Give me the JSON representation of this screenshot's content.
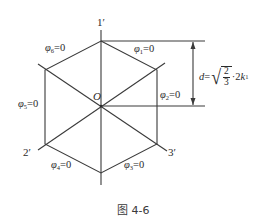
{
  "figure": {
    "caption": "图 4-6",
    "origin_label": "O",
    "axis_labels": {
      "axis1": "1′",
      "axis2": "2′",
      "axis3": "3′"
    },
    "edge_labels": [
      {
        "symbol": "φ",
        "index": "1",
        "rest": "=0"
      },
      {
        "symbol": "φ",
        "index": "2",
        "rest": "=0"
      },
      {
        "symbol": "φ",
        "index": "3",
        "rest": "=0"
      },
      {
        "symbol": "φ",
        "index": "4",
        "rest": "=0"
      },
      {
        "symbol": "φ",
        "index": "5",
        "rest": "=0"
      },
      {
        "symbol": "φ",
        "index": "6",
        "rest": "=0"
      }
    ],
    "dimension": {
      "var": "d",
      "eq": "=",
      "frac_num": "2",
      "frac_den": "3",
      "mult": "·2",
      "k": "k",
      "k_index": "1"
    },
    "colors": {
      "line": "#3a3a3a",
      "text": "#2a2a2a",
      "background": "#ffffff"
    }
  }
}
